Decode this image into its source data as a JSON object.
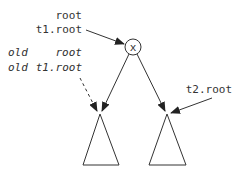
{
  "diagram": {
    "node": {
      "label": "x"
    },
    "labels": {
      "root": "root",
      "t1_root": "t1.root",
      "old1_prefix": "old",
      "old1_name": "root",
      "old2_prefix": "old",
      "old2_name": "t1.root",
      "t2_root": "t2.root"
    },
    "colors": {
      "stroke": "#333333",
      "background": "#ffffff"
    }
  }
}
